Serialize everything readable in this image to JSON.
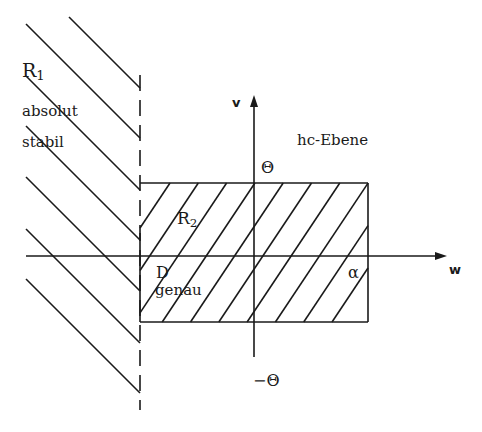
{
  "diagram": {
    "stroke_color": "#1a1a1a",
    "background": "#ffffff",
    "labels": {
      "r1_main": "R",
      "r1_sub": "1",
      "absolut": "absolut",
      "stabil": "stabil",
      "v_axis": "v",
      "hc_ebene": "hc-Ebene",
      "theta_top": "Θ",
      "r2_main": "R",
      "r2_sub": "2",
      "d_label": "D",
      "genau": "genau",
      "alpha": "α",
      "w_axis": "w",
      "theta_bottom": "−Θ"
    },
    "regions": [
      {
        "id": "R1",
        "description": "absolut stabil",
        "hatch": "diagonal-down-right",
        "bounded_by": "dashed vertical line x=140"
      },
      {
        "id": "R2",
        "description": "hatched rectangle [−D, α] × [−Θ, Θ]",
        "hatch": "diagonal-up-right"
      }
    ],
    "axes": {
      "w": {
        "x1": 26,
        "y": 256,
        "x2": 440
      },
      "v": {
        "x": 254,
        "y1": 357,
        "y2": 102
      }
    },
    "dashed_line": {
      "x": 140,
      "y1": 75,
      "y2": 410
    },
    "rectangle": {
      "x1": 140,
      "y1": 183,
      "x2": 368,
      "y2": 322
    },
    "r1_lines": [
      {
        "x1": 69,
        "y1": 17,
        "x2": 140,
        "y2": 88
      },
      {
        "x1": 26,
        "y1": 24,
        "x2": 140,
        "y2": 138
      },
      {
        "x1": 26,
        "y1": 76,
        "x2": 140,
        "y2": 190
      },
      {
        "x1": 26,
        "y1": 126,
        "x2": 140,
        "y2": 240
      },
      {
        "x1": 26,
        "y1": 177,
        "x2": 140,
        "y2": 291
      },
      {
        "x1": 26,
        "y1": 229,
        "x2": 140,
        "y2": 343
      },
      {
        "x1": 26,
        "y1": 279,
        "x2": 140,
        "y2": 393
      }
    ],
    "hatch": {
      "top_start_x": 170,
      "spacing": 28.3,
      "count": 10,
      "slope": 1.5
    }
  }
}
